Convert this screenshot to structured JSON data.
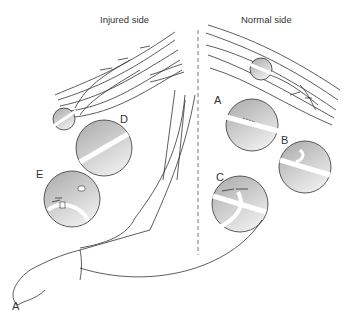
{
  "diagram": {
    "headings": {
      "left": "Injured side",
      "right": "Normal side"
    },
    "figure_label": "A",
    "insets": [
      {
        "id": "A",
        "label": "A",
        "description": "nerve with small transverse incision"
      },
      {
        "id": "B",
        "label": "B",
        "description": "nerve with branch reflected, arrow"
      },
      {
        "id": "C",
        "label": "C",
        "description": "nerve with looped graft and arrows"
      },
      {
        "id": "D",
        "label": "D",
        "description": "transected nerve segment"
      },
      {
        "id": "E",
        "label": "E",
        "description": "nerve ends with graft coaptation and arrows"
      }
    ],
    "colors": {
      "line": "#333333",
      "inset_fill_dark": "#b8b8b8",
      "inset_fill_light": "#e4e4e4",
      "divider": "#555555"
    }
  }
}
